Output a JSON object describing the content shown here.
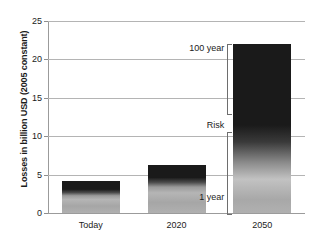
{
  "chart_data": {
    "type": "bar",
    "title": "",
    "xlabel": "",
    "ylabel": "Losses in billion USD (2005 constant)",
    "categories": [
      "Today",
      "2020",
      "2050"
    ],
    "values": [
      4.2,
      6.2,
      22.0
    ],
    "ylim": [
      0,
      25
    ],
    "yticks": [
      0,
      5,
      10,
      15,
      20,
      25
    ],
    "ytick_labels": [
      "0",
      "5",
      "10",
      "15",
      "20",
      "25"
    ],
    "grid": true,
    "legend": false,
    "series": [
      {
        "name": "Losses",
        "values": [
          4.2,
          6.2,
          22.0
        ]
      }
    ],
    "annotations": [
      {
        "text": "100 year",
        "value_range": [
          13.0,
          22.0
        ],
        "description": "upper bracket spanning the dark top portion of the 2050 bar"
      },
      {
        "text": "Risk",
        "value_range": [
          10.5,
          12.5
        ],
        "description": "axis label for the risk-return-period bracket group"
      },
      {
        "text": "1 year",
        "value_range": [
          0.0,
          10.5
        ],
        "description": "lower bracket spanning the light bottom portion of the 2050 bar"
      }
    ],
    "bar_style": {
      "description": "each bar is a vertical gradient, light gray at the base darkening to near-black at the top",
      "top_color": "#1a1a1a",
      "bottom_color": "#b0b0b0"
    }
  },
  "axis": {
    "y_title": "Losses in billion USD (2005 constant)",
    "y_labels": [
      "25",
      "20",
      "15",
      "10",
      "5",
      "0"
    ],
    "x_labels": [
      "Today",
      "2020",
      "2050"
    ]
  },
  "annotations": {
    "hundred_year": "100 year",
    "risk": "Risk",
    "one_year": "1 year"
  },
  "colors": {
    "grid": "#b4b4b4",
    "axis": "#9b9b9b",
    "text": "#1b1b1b",
    "bar_top": "#1a1a1a",
    "bar_bottom": "#b0b0b0",
    "bracket": "#6e6e6e",
    "background": "#ffffff"
  }
}
